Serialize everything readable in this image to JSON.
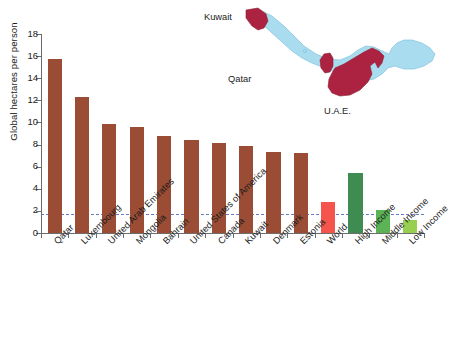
{
  "chart_data": {
    "type": "bar",
    "title": "",
    "xlabel": "",
    "ylabel": "Global hectares per person",
    "ylim": [
      0,
      18
    ],
    "yticks": [
      0,
      2,
      4,
      6,
      8,
      10,
      12,
      14,
      16,
      18
    ],
    "ytick_labels": [
      "0",
      "2",
      "4",
      "6",
      "8",
      "10",
      "12",
      "14",
      "16",
      "18"
    ],
    "grid": false,
    "legend": "none",
    "categories": [
      "Qatar",
      "Luxembourg",
      "United Arab Emirates",
      "Mongolia",
      "Bahrain",
      "United States of America",
      "Canada",
      "Kuwait",
      "Denmark",
      "Estonia",
      "World",
      "High Income",
      "Middle Income",
      "Low Income"
    ],
    "values": [
      15.7,
      12.3,
      9.85,
      9.55,
      8.75,
      8.45,
      8.1,
      7.9,
      7.35,
      7.25,
      2.8,
      5.45,
      2.1,
      1.2
    ],
    "bar_colors": [
      "#9b4c34",
      "#9b4c34",
      "#9b4c34",
      "#9b4c34",
      "#9b4c34",
      "#9b4c34",
      "#9b4c34",
      "#9b4c34",
      "#9b4c34",
      "#9b4c34",
      "#f4544c",
      "#3f8c52",
      "#5cb356",
      "#97cf4e"
    ],
    "annotations": [
      {
        "name": "world-biocapacity-reference-line",
        "type": "hline",
        "value": 1.7,
        "color": "#5a6fc0",
        "style": "dashed"
      }
    ]
  },
  "map_inset": {
    "name": "persian-gulf-map",
    "water_color": "#aadcf0",
    "highlight_color": "#ab2340",
    "labels": {
      "kuwait": "Kuwait",
      "qatar": "Qatar",
      "uae": "U.A.E."
    }
  },
  "caption": {
    "text": ""
  }
}
